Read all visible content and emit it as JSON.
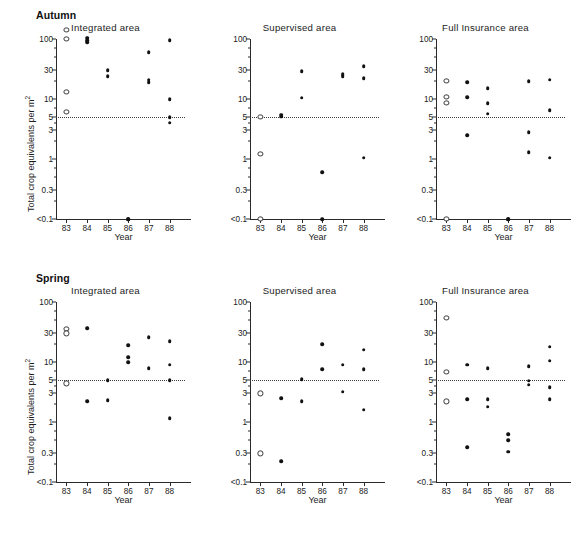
{
  "figure": {
    "ylabel": "Total crop equivalents per m",
    "ylabel_sup": "2",
    "xlabel": "Year",
    "threshold_value": 5,
    "accent": "#111111",
    "threshold_color": "#3a3a3a"
  },
  "sections": [
    {
      "id": "autumn",
      "label": "Autumn"
    },
    {
      "id": "spring",
      "label": "Spring"
    }
  ],
  "axis": {
    "y_ticks": [
      "100",
      "30",
      "10",
      "5",
      "3",
      "1",
      "0.3",
      "<0.1"
    ],
    "y_tick_values": [
      100,
      30,
      10,
      5,
      3,
      1,
      0.3,
      0.1
    ],
    "y_minor_values": [
      70,
      50,
      20,
      7,
      4,
      2,
      0.7,
      0.5,
      0.2
    ],
    "x_ticks": [
      "83",
      "84",
      "85",
      "86",
      "87",
      "88"
    ],
    "x_tick_values": [
      83,
      84,
      85,
      86,
      87,
      88
    ],
    "ylim": [
      0.1,
      100
    ],
    "xlim": [
      82.5,
      88.7
    ],
    "scale": "log",
    "grid": false
  },
  "chart_data": {
    "type": "scatter",
    "xlabel": "Year",
    "ylabel": "Total crop equivalents per m2",
    "ylim": [
      0.1,
      100
    ],
    "xlim": [
      82.5,
      88.7
    ],
    "yscale": "log",
    "ytick_labels": [
      "100",
      "30",
      "10",
      "5",
      "3",
      "1",
      "0.3",
      "<0.1"
    ],
    "xtick_labels": [
      "83",
      "84",
      "85",
      "86",
      "87",
      "88"
    ],
    "annotations": [
      {
        "type": "hline",
        "y": 5,
        "style": "dotted",
        "label": "threshold = 5"
      }
    ],
    "legend": [
      {
        "marker": "open-circle",
        "meaning": "pre-treatment / baseline year"
      },
      {
        "marker": "filled-circle",
        "meaning": "treatment year observation"
      }
    ],
    "legend_position": "none",
    "panels": [
      {
        "season": "Autumn",
        "area": "Integrated area",
        "series": [
          {
            "name": "baseline",
            "marker": "open",
            "points": [
              {
                "x": 83,
                "y": 140
              },
              {
                "x": 83,
                "y": 100
              },
              {
                "x": 83,
                "y": 13
              },
              {
                "x": 83,
                "y": 6
              }
            ]
          },
          {
            "name": "observed",
            "marker": "filled",
            "points": [
              {
                "x": 84,
                "y": 105
              },
              {
                "x": 84,
                "y": 95
              },
              {
                "x": 84,
                "y": 88
              },
              {
                "x": 85,
                "y": 30
              },
              {
                "x": 85,
                "y": 24
              },
              {
                "x": 86,
                "y": 0.1
              },
              {
                "x": 86,
                "y": 0.1
              },
              {
                "x": 87,
                "y": 60
              },
              {
                "x": 87,
                "y": 21
              },
              {
                "x": 87,
                "y": 19
              },
              {
                "x": 88,
                "y": 95
              },
              {
                "x": 88,
                "y": 10
              },
              {
                "x": 88,
                "y": 5
              },
              {
                "x": 88,
                "y": 4
              }
            ]
          }
        ]
      },
      {
        "season": "Autumn",
        "area": "Supervised area",
        "series": [
          {
            "name": "baseline",
            "marker": "open",
            "points": [
              {
                "x": 83,
                "y": 5
              },
              {
                "x": 83,
                "y": 1.2
              },
              {
                "x": 83,
                "y": 0.1
              }
            ]
          },
          {
            "name": "observed",
            "marker": "filled",
            "points": [
              {
                "x": 84,
                "y": 5.5
              },
              {
                "x": 84,
                "y": 5.1
              },
              {
                "x": 85,
                "y": 29
              },
              {
                "x": 85,
                "y": 10.5
              },
              {
                "x": 86,
                "y": 0.6
              },
              {
                "x": 86,
                "y": 0.1
              },
              {
                "x": 87,
                "y": 26
              },
              {
                "x": 87,
                "y": 24
              },
              {
                "x": 88,
                "y": 35
              },
              {
                "x": 88,
                "y": 22
              },
              {
                "x": 88,
                "y": 1.05
              }
            ]
          }
        ]
      },
      {
        "season": "Autumn",
        "area": "Full Insurance area",
        "series": [
          {
            "name": "baseline",
            "marker": "open",
            "points": [
              {
                "x": 83,
                "y": 20
              },
              {
                "x": 83,
                "y": 11
              },
              {
                "x": 83,
                "y": 8.5
              },
              {
                "x": 83,
                "y": 0.1
              }
            ]
          },
          {
            "name": "observed",
            "marker": "filled",
            "points": [
              {
                "x": 84,
                "y": 19
              },
              {
                "x": 84,
                "y": 10.8
              },
              {
                "x": 84,
                "y": 2.5
              },
              {
                "x": 85,
                "y": 15
              },
              {
                "x": 85,
                "y": 8.5
              },
              {
                "x": 85,
                "y": 5.7
              },
              {
                "x": 86,
                "y": 0.1
              },
              {
                "x": 86,
                "y": 0.1
              },
              {
                "x": 87,
                "y": 20
              },
              {
                "x": 87,
                "y": 2.8
              },
              {
                "x": 87,
                "y": 1.3
              },
              {
                "x": 88,
                "y": 21
              },
              {
                "x": 88,
                "y": 6.5
              },
              {
                "x": 88,
                "y": 1.05
              }
            ]
          }
        ]
      },
      {
        "season": "Spring",
        "area": "Integrated area",
        "series": [
          {
            "name": "baseline",
            "marker": "open",
            "points": [
              {
                "x": 83,
                "y": 36
              },
              {
                "x": 83,
                "y": 30
              },
              {
                "x": 83,
                "y": 4.4
              }
            ]
          },
          {
            "name": "observed",
            "marker": "filled",
            "points": [
              {
                "x": 84,
                "y": 37
              },
              {
                "x": 84,
                "y": 2.2
              },
              {
                "x": 85,
                "y": 5
              },
              {
                "x": 85,
                "y": 2.3
              },
              {
                "x": 86,
                "y": 19
              },
              {
                "x": 86,
                "y": 12
              },
              {
                "x": 86,
                "y": 10
              },
              {
                "x": 87,
                "y": 26
              },
              {
                "x": 87,
                "y": 7.8
              },
              {
                "x": 88,
                "y": 22
              },
              {
                "x": 88,
                "y": 9
              },
              {
                "x": 88,
                "y": 5
              },
              {
                "x": 88,
                "y": 1.15
              }
            ]
          }
        ]
      },
      {
        "season": "Spring",
        "area": "Supervised area",
        "series": [
          {
            "name": "baseline",
            "marker": "open",
            "points": [
              {
                "x": 83,
                "y": 3
              },
              {
                "x": 83,
                "y": 0.3
              }
            ]
          },
          {
            "name": "observed",
            "marker": "filled",
            "points": [
              {
                "x": 84,
                "y": 2.5
              },
              {
                "x": 84,
                "y": 0.22
              },
              {
                "x": 85,
                "y": 5.2
              },
              {
                "x": 85,
                "y": 2.2
              },
              {
                "x": 86,
                "y": 20
              },
              {
                "x": 86,
                "y": 7.5
              },
              {
                "x": 87,
                "y": 9
              },
              {
                "x": 87,
                "y": 3.2
              },
              {
                "x": 88,
                "y": 16
              },
              {
                "x": 88,
                "y": 7.5
              },
              {
                "x": 88,
                "y": 1.6
              }
            ]
          }
        ]
      },
      {
        "season": "Spring",
        "area": "Full Insurance area",
        "series": [
          {
            "name": "baseline",
            "marker": "open",
            "points": [
              {
                "x": 83,
                "y": 55
              },
              {
                "x": 83,
                "y": 6.8
              },
              {
                "x": 83,
                "y": 2.2
              }
            ]
          },
          {
            "name": "observed",
            "marker": "filled",
            "points": [
              {
                "x": 84,
                "y": 9
              },
              {
                "x": 84,
                "y": 2.4
              },
              {
                "x": 84,
                "y": 0.38
              },
              {
                "x": 85,
                "y": 7.8
              },
              {
                "x": 85,
                "y": 2.4
              },
              {
                "x": 85,
                "y": 1.8
              },
              {
                "x": 86,
                "y": 0.62
              },
              {
                "x": 86,
                "y": 0.5
              },
              {
                "x": 86,
                "y": 0.32
              },
              {
                "x": 87,
                "y": 8.5
              },
              {
                "x": 87,
                "y": 4.9
              },
              {
                "x": 87,
                "y": 4.2
              },
              {
                "x": 88,
                "y": 18
              },
              {
                "x": 88,
                "y": 10.5
              },
              {
                "x": 88,
                "y": 3.8
              },
              {
                "x": 88,
                "y": 2.4
              }
            ]
          }
        ]
      }
    ]
  }
}
